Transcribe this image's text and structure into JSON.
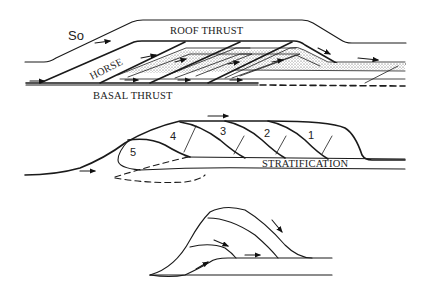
{
  "figure": {
    "panels": [
      {
        "id": "duplex",
        "labels": {
          "so": "So",
          "roof_thrust": "ROOF THRUST",
          "horse": "HORSE",
          "basal_thrust": "BASAL THRUST"
        }
      },
      {
        "id": "imbricate-stack",
        "labels": {
          "stratification": "STRATIFICATION",
          "sheets": [
            "1",
            "2",
            "3",
            "4",
            "5"
          ]
        }
      },
      {
        "id": "nappe-stack",
        "labels": {}
      }
    ],
    "colors": {
      "ink": "#1a1a1a",
      "background": "#ffffff"
    }
  }
}
